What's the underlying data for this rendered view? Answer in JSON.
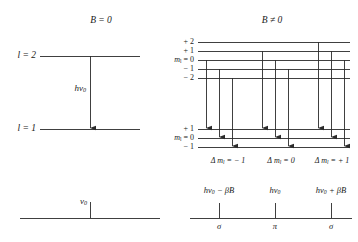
{
  "figure": {
    "title_no_field": "B = 0",
    "title_field": "B ≠ 0",
    "width": 358,
    "height": 242,
    "line_color": "#2b2b2b",
    "background": "#ffffff"
  },
  "left_panel": {
    "upper_level_label": "l = 2",
    "lower_level_label": "l = 1",
    "transition_label": "hν",
    "transition_label_sub": "0",
    "spectrum_line_label": "ν",
    "spectrum_line_label_sub": "0",
    "upper_level_y": 56,
    "lower_level_y": 129,
    "level_x1": 40,
    "level_x2": 140,
    "arrow_x": 90,
    "spectrum_axis_y": 218,
    "spectrum_tick_x": 90
  },
  "right_panel": {
    "upper_sublevels": [
      {
        "m": "+ 2",
        "y": 42
      },
      {
        "m": "+ 1",
        "y": 51
      },
      {
        "m": "0",
        "y": 60,
        "prefix": "m",
        "prefix_sub": "l",
        "eq": "="
      },
      {
        "m": "− 1",
        "y": 69
      },
      {
        "m": "− 2",
        "y": 78
      }
    ],
    "lower_sublevels": [
      {
        "m": "+ 1",
        "y": 129
      },
      {
        "m": "0",
        "y": 138,
        "prefix": "m",
        "prefix_sub": "l",
        "eq": "="
      },
      {
        "m": "− 1",
        "y": 147
      }
    ],
    "level_x1": 198,
    "level_x2": 350,
    "transition_groups": [
      {
        "name": "delta-minus-one",
        "label_prefix": "Δ",
        "label_m": "m",
        "label_m_sub": "l",
        "label_value": "= − 1",
        "label_x": 228,
        "arrows": [
          {
            "x": 206,
            "y_from": 60,
            "y_to": 129
          },
          {
            "x": 219,
            "y_from": 69,
            "y_to": 138
          },
          {
            "x": 232,
            "y_from": 78,
            "y_to": 147
          }
        ]
      },
      {
        "name": "delta-zero",
        "label_prefix": "Δ",
        "label_m": "m",
        "label_m_sub": "l",
        "label_value": "= 0",
        "label_x": 281,
        "arrows": [
          {
            "x": 262,
            "y_from": 51,
            "y_to": 129
          },
          {
            "x": 275,
            "y_from": 60,
            "y_to": 138
          },
          {
            "x": 288,
            "y_from": 69,
            "y_to": 147
          }
        ]
      },
      {
        "name": "delta-plus-one",
        "label_prefix": "Δ",
        "label_m": "m",
        "label_m_sub": "l",
        "label_value": "= + 1",
        "label_x": 330,
        "arrows": [
          {
            "x": 318,
            "y_from": 42,
            "y_to": 129
          },
          {
            "x": 331,
            "y_from": 51,
            "y_to": 138
          },
          {
            "x": 344,
            "y_from": 60,
            "y_to": 147
          }
        ]
      }
    ],
    "delta_label_y": 157,
    "spectrum": {
      "axis_y": 218,
      "axis_x1": 190,
      "axis_x2": 352,
      "lines": [
        {
          "name": "sigma-minus",
          "x": 219,
          "energy": "hν",
          "energy_sub": "0",
          "energy_suffix": " − βB",
          "polarization": "σ"
        },
        {
          "name": "pi",
          "x": 275,
          "energy": "hν",
          "energy_sub": "0",
          "energy_suffix": "",
          "polarization": "π"
        },
        {
          "name": "sigma-plus",
          "x": 331,
          "energy": "hν",
          "energy_sub": "0",
          "energy_suffix": " + βB",
          "polarization": "σ"
        }
      ],
      "energy_label_y": 188,
      "tick_top_y": 203,
      "pol_label_y": 223
    }
  }
}
